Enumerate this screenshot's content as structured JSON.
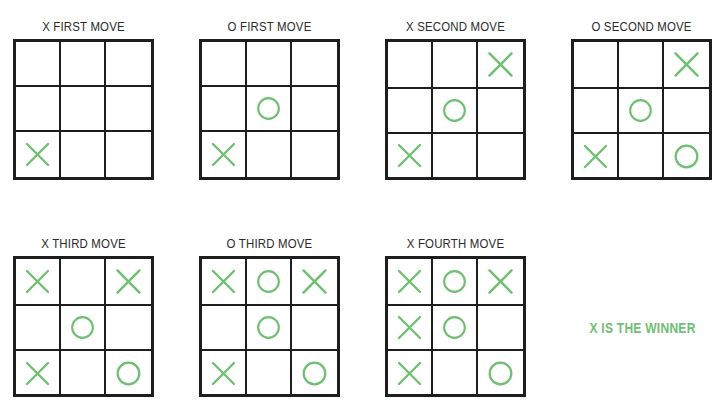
{
  "colors": {
    "mark": "#6fbf73",
    "grid": "#1e1e1e",
    "title": "#2b2b2b",
    "background": "#ffffff"
  },
  "boards": [
    {
      "title": "X FIRST MOVE",
      "x": 13,
      "y": 19,
      "cells": [
        "",
        "",
        "",
        "",
        "",
        "",
        "X",
        "",
        ""
      ]
    },
    {
      "title": "O FIRST MOVE",
      "x": 199,
      "y": 19,
      "cells": [
        "",
        "",
        "",
        "",
        "O",
        "",
        "X",
        "",
        ""
      ]
    },
    {
      "title": "X SECOND MOVE",
      "x": 385,
      "y": 19,
      "cells": [
        "",
        "",
        "X",
        "",
        "O",
        "",
        "X",
        "",
        ""
      ]
    },
    {
      "title": "O SECOND MOVE",
      "x": 571,
      "y": 19,
      "cells": [
        "",
        "",
        "X",
        "",
        "O",
        "",
        "X",
        "",
        "O"
      ]
    },
    {
      "title": "X THIRD MOVE",
      "x": 13,
      "y": 236,
      "cells": [
        "X",
        "",
        "X",
        "",
        "O",
        "",
        "X",
        "",
        "O"
      ]
    },
    {
      "title": "O THIRD MOVE",
      "x": 199,
      "y": 236,
      "cells": [
        "X",
        "O",
        "X",
        "",
        "O",
        "",
        "X",
        "",
        "O"
      ]
    },
    {
      "title": "X FOURTH MOVE",
      "x": 385,
      "y": 236,
      "cells": [
        "X",
        "O",
        "X",
        "X",
        "O",
        "",
        "X",
        "",
        "O"
      ]
    }
  ],
  "winner": {
    "text": "X IS THE WINNER"
  }
}
